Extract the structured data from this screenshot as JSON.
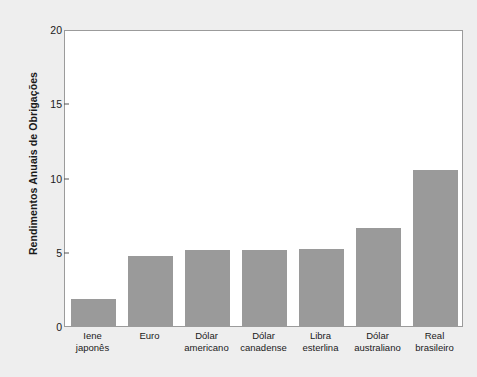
{
  "chart_data": {
    "type": "bar",
    "title": "",
    "xlabel": "",
    "ylabel": "Rendimentos Anuais de Obrigações",
    "categories": [
      "Iene\njaponês",
      "Euro",
      "Dólar\namericano",
      "Dólar\ncanadense",
      "Libra\nesterlina",
      "Dólar\naustraliano",
      "Real\nbrasileiro"
    ],
    "values": [
      1.8,
      4.7,
      5.1,
      5.1,
      5.2,
      6.6,
      10.5
    ],
    "ylim": [
      0,
      20
    ],
    "yticks": [
      0,
      5,
      10,
      15,
      20
    ],
    "ytick_labels": [
      "0",
      "5",
      "10",
      "15",
      "20"
    ],
    "grid": false,
    "legend": null,
    "bar_color": "#9a9a9a",
    "plot_background": "#ffffff",
    "figure_background": "#eeeeee",
    "axis_color": "#9b9b9b",
    "text_color": "#1a1a1a"
  }
}
